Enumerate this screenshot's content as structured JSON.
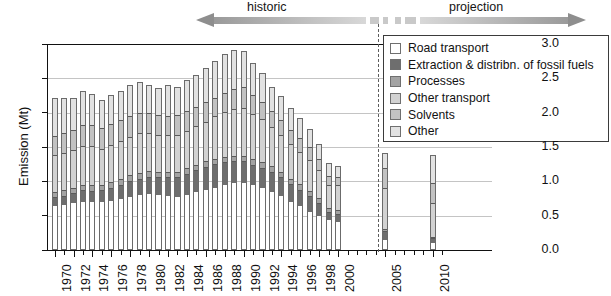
{
  "figure": {
    "title": "",
    "y_axis_title": "Emission (Mt)",
    "period_left_label": "historic",
    "period_right_label": "projection"
  },
  "legend": {
    "items": [
      {
        "label": "Road transport",
        "color": "#ffffff"
      },
      {
        "label": "Extraction & distribn. of fossil fuels",
        "color": "#6e6e6e"
      },
      {
        "label": "Processes",
        "color": "#a3a3a3"
      },
      {
        "label": "Other transport",
        "color": "#d2d2d2"
      },
      {
        "label": "Solvents",
        "color": "#c2c2c2"
      },
      {
        "label": "Other",
        "color": "#e2e2e2"
      }
    ]
  },
  "chart_data": {
    "type": "bar",
    "stacked": true,
    "title": "",
    "xlabel": "",
    "ylabel": "Emission (Mt)",
    "ylim": [
      0.0,
      3.0
    ],
    "yticks": [
      "0.0",
      "0.5",
      "1.0",
      "1.5",
      "2.0",
      "2.5",
      "3.0"
    ],
    "ytick_values": [
      0.0,
      0.5,
      1.0,
      1.5,
      2.0,
      2.5,
      3.0
    ],
    "grid": true,
    "legend_position": "top-right",
    "categories": [
      "1970",
      "1971",
      "1972",
      "1973",
      "1974",
      "1975",
      "1976",
      "1977",
      "1978",
      "1979",
      "1980",
      "1981",
      "1982",
      "1983",
      "1984",
      "1985",
      "1986",
      "1987",
      "1988",
      "1989",
      "1990",
      "1991",
      "1992",
      "1993",
      "1994",
      "1995",
      "1996",
      "1997",
      "1998",
      "1999",
      "2000",
      "2005",
      "2010"
    ],
    "xtick_labels": [
      "1970",
      "1972",
      "1974",
      "1976",
      "1978",
      "1980",
      "1982",
      "1984",
      "1986",
      "1988",
      "1990",
      "1992",
      "1994",
      "1996",
      "1998",
      "2000",
      "2005",
      "2010"
    ],
    "projection_start_category": "2000",
    "divider_between": [
      "1999",
      "2000"
    ],
    "series": [
      {
        "name": "Road transport",
        "color": "#ffffff",
        "values": [
          0.64,
          0.66,
          0.68,
          0.7,
          0.7,
          0.7,
          0.72,
          0.74,
          0.77,
          0.8,
          0.82,
          0.8,
          0.78,
          0.77,
          0.8,
          0.84,
          0.88,
          0.9,
          0.95,
          0.98,
          0.98,
          0.94,
          0.9,
          0.84,
          0.78,
          0.7,
          0.64,
          0.56,
          0.5,
          0.43,
          0.41,
          0.14,
          0.1
        ]
      },
      {
        "name": "Extraction & distribn. of fossil fuels",
        "color": "#6e6e6e",
        "values": [
          0.13,
          0.13,
          0.15,
          0.17,
          0.16,
          0.17,
          0.19,
          0.21,
          0.24,
          0.24,
          0.25,
          0.26,
          0.28,
          0.29,
          0.31,
          0.32,
          0.33,
          0.35,
          0.33,
          0.31,
          0.31,
          0.3,
          0.3,
          0.3,
          0.28,
          0.26,
          0.24,
          0.22,
          0.18,
          0.12,
          0.12,
          0.14,
          0.07
        ]
      },
      {
        "name": "Processes",
        "color": "#a3a3a3",
        "values": [
          0.08,
          0.08,
          0.08,
          0.08,
          0.08,
          0.08,
          0.08,
          0.08,
          0.08,
          0.08,
          0.08,
          0.08,
          0.08,
          0.08,
          0.08,
          0.08,
          0.08,
          0.08,
          0.08,
          0.08,
          0.08,
          0.08,
          0.08,
          0.08,
          0.08,
          0.08,
          0.08,
          0.08,
          0.08,
          0.06,
          0.06,
          0.02,
          0.02
        ]
      },
      {
        "name": "Other transport",
        "color": "#d2d2d2",
        "values": [
          0.54,
          0.54,
          0.54,
          0.57,
          0.58,
          0.52,
          0.54,
          0.56,
          0.56,
          0.58,
          0.56,
          0.54,
          0.54,
          0.54,
          0.55,
          0.57,
          0.58,
          0.62,
          0.65,
          0.68,
          0.7,
          0.66,
          0.63,
          0.57,
          0.54,
          0.5,
          0.47,
          0.45,
          0.4,
          0.34,
          0.35,
          0.6,
          0.5
        ]
      },
      {
        "name": "Solvents",
        "color": "#c2c2c2",
        "values": [
          0.27,
          0.3,
          0.3,
          0.3,
          0.3,
          0.3,
          0.3,
          0.31,
          0.3,
          0.29,
          0.28,
          0.28,
          0.27,
          0.28,
          0.28,
          0.28,
          0.28,
          0.27,
          0.28,
          0.3,
          0.3,
          0.28,
          0.25,
          0.23,
          0.22,
          0.21,
          0.2,
          0.19,
          0.17,
          0.13,
          0.12,
          0.3,
          0.28
        ]
      },
      {
        "name": "Other",
        "color": "#e2e2e2",
        "values": [
          0.56,
          0.51,
          0.47,
          0.49,
          0.45,
          0.41,
          0.43,
          0.41,
          0.46,
          0.46,
          0.41,
          0.4,
          0.45,
          0.42,
          0.46,
          0.46,
          0.5,
          0.53,
          0.56,
          0.56,
          0.53,
          0.47,
          0.42,
          0.36,
          0.34,
          0.32,
          0.29,
          0.26,
          0.22,
          0.18,
          0.17,
          0.22,
          0.41
        ]
      }
    ]
  }
}
